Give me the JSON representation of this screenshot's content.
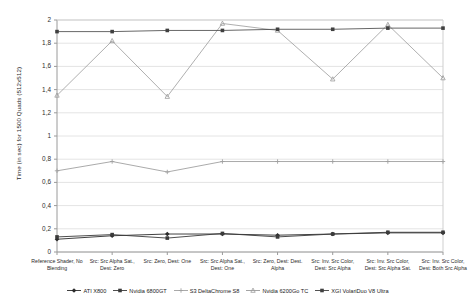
{
  "chart_data": {
    "type": "line",
    "title": "",
    "xlabel": "",
    "ylabel": "Time (in sec) for 1500 Quads (512x512)",
    "ylim": [
      0,
      2
    ],
    "yticks": [
      "0",
      "0,2",
      "0,4",
      "0,6",
      "0,8",
      "1",
      "1,2",
      "1,4",
      "1,6",
      "1,8",
      "2"
    ],
    "grid": true,
    "legend_position": "bottom",
    "categories": [
      "Reference Shader, No\nBlending",
      "Src: Src Alpha Sat.,\nDest: Zero",
      "Src: Zero, Dest: One",
      "Src: Src Alpha Sat.,\nDest: One",
      "Src: Zero, Dest: Dest.\nAlpha",
      "Src: Inv. Src Color,\nDest: Src Alpha",
      "Src: Inv. Src Color,\nDest: Src Alpha Sat.",
      "Src: Inv. Src Color,\nDest: Both Src Alpha"
    ],
    "series": [
      {
        "name": "ATI X800",
        "color": "#2b2b2b",
        "marker": "diamond",
        "values": [
          0.11,
          0.14,
          0.155,
          0.155,
          0.145,
          0.155,
          0.165,
          0.165
        ]
      },
      {
        "name": "Nvidia 6800GT",
        "color": "#3a3a3a",
        "marker": "square",
        "values": [
          0.13,
          0.15,
          0.12,
          0.16,
          0.13,
          0.155,
          0.17,
          0.17
        ]
      },
      {
        "name": "S3 DeltaChrome S8",
        "color": "#a0a0a0",
        "marker": "plus",
        "values": [
          0.7,
          0.78,
          0.69,
          0.78,
          0.78,
          0.78,
          0.78,
          0.78
        ]
      },
      {
        "name": "Nvidia 6200Go TC",
        "color": "#9a9a9a",
        "marker": "triangle",
        "values": [
          1.35,
          1.82,
          1.34,
          1.97,
          1.91,
          1.49,
          1.96,
          1.5
        ]
      },
      {
        "name": "XGI VolariDuo V8 Ultra",
        "color": "#404040",
        "marker": "square",
        "values": [
          1.9,
          1.9,
          1.91,
          1.91,
          1.92,
          1.92,
          1.93,
          1.93
        ]
      }
    ]
  }
}
